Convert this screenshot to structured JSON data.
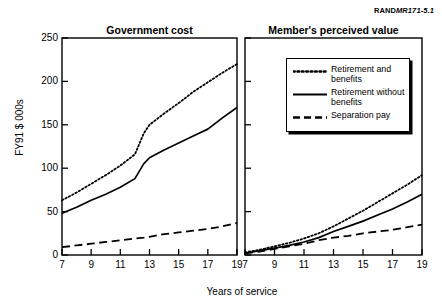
{
  "source_label": {
    "prefix": "RAND",
    "code": "MR171-5.1"
  },
  "chart_data": {
    "type": "line",
    "title": "",
    "xlabel": "Years of service",
    "ylabel": "FY91 $ 000s",
    "xlim": [
      7,
      19
    ],
    "ylim": [
      0,
      250
    ],
    "yticks": [
      "0",
      "50",
      "100",
      "150",
      "200",
      "250"
    ],
    "ytick_values": [
      0,
      50,
      100,
      150,
      200,
      250
    ],
    "xticks": [
      "7",
      "9",
      "11",
      "13",
      "15",
      "17",
      "19"
    ],
    "xtick_values": [
      7,
      9,
      11,
      13,
      15,
      17,
      19
    ],
    "grid": false,
    "legend_position": "upper-left-of-right-panel",
    "panels": [
      {
        "title": "Government cost",
        "x": [
          7,
          8,
          9,
          10,
          11,
          12,
          12.6,
          13,
          14,
          15,
          16,
          17,
          18,
          19
        ],
        "series": [
          {
            "name": "Retirement and benefits",
            "style": "dotted",
            "values": [
              63,
              72,
              82,
              92,
              103,
              116,
              140,
              150,
              163,
              175,
              188,
              199,
              210,
              220
            ]
          },
          {
            "name": "Retirement without benefits",
            "style": "solid",
            "values": [
              48,
              55,
              63,
              70,
              78,
              88,
              105,
              112,
              121,
              129,
              137,
              145,
              158,
              170
            ]
          },
          {
            "name": "Separation pay",
            "style": "dashed",
            "values": [
              9,
              11,
              13,
              15,
              17,
              19,
              20,
              21,
              24,
              26,
              28,
              30,
              33,
              37
            ]
          }
        ]
      },
      {
        "title": "Member's perceived value",
        "x": [
          7,
          8,
          9,
          10,
          11,
          12,
          13,
          14,
          15,
          16,
          17,
          18,
          19
        ],
        "series": [
          {
            "name": "Retirement and benefits",
            "style": "dotted",
            "values": [
              3,
              6,
              10,
              14,
              19,
              25,
              33,
              42,
              51,
              61,
              71,
              81,
              92
            ]
          },
          {
            "name": "Retirement without benefits",
            "style": "solid",
            "values": [
              2,
              5,
              8,
              11,
              15,
              20,
              27,
              33,
              39,
              46,
              53,
              61,
              70
            ]
          },
          {
            "name": "Separation pay",
            "style": "dashed",
            "values": [
              2,
              4,
              7,
              10,
              13,
              17,
              20,
              22,
              25,
              27,
              29,
              32,
              35
            ]
          }
        ]
      }
    ],
    "legend": [
      {
        "label": "Retirement and benefits",
        "style": "dotted"
      },
      {
        "label": "Retirement without benefits",
        "style": "solid"
      },
      {
        "label": "Separation pay",
        "style": "dashed"
      }
    ]
  }
}
